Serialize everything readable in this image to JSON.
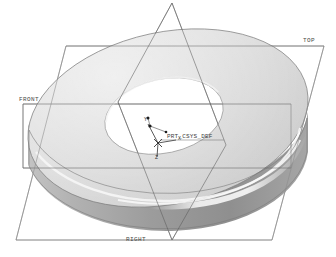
{
  "viewport": {
    "background_color": "#ffffff",
    "model_name": "torus-washer-solid"
  },
  "datum_planes": [
    {
      "id": "top",
      "label": "TOP",
      "label_x": 303,
      "label_y": 40
    },
    {
      "id": "front",
      "label": "FRONT",
      "label_x": 20,
      "label_y": 99
    },
    {
      "id": "right",
      "label": "RIGHT",
      "label_x": 126,
      "label_y": 239
    }
  ],
  "coordinate_system": {
    "name": "PRT_CSYS_DEF",
    "label_x": 166,
    "label_y": 134,
    "origin_x": 158,
    "origin_y": 143,
    "axes": [
      {
        "name": "X",
        "label": "X",
        "label_x": 178,
        "label_y": 139
      },
      {
        "name": "Y",
        "label": "Y",
        "label_x": 146,
        "label_y": 122
      },
      {
        "name": "Z",
        "label": "Z",
        "label_x": 155,
        "label_y": 156
      }
    ]
  },
  "colors": {
    "top_face": "#d7d7d7",
    "top_face_light": "#e2e2e2",
    "outer_wall": "#9c9c9c",
    "outer_wall_dark": "#8a8a8a",
    "inner_bore": "#b9b9b9",
    "inner_bore_dark": "#a4a4a4",
    "highlight": "#f2f2f2",
    "datum_line": "#6e6e6e",
    "datum_line_soft": "#8d8d8d",
    "outline": "#707070",
    "csys_line": "#3a3a3a",
    "text": "#4a4a4a"
  },
  "geometry": {
    "top_ellipse": {
      "cx": 168,
      "cy": 118,
      "rx": 142,
      "ry": 86,
      "rot": -12
    },
    "bore_ellipse": {
      "cx": 164,
      "cy": 116,
      "rx": 60,
      "ry": 37,
      "rot": -12
    },
    "extrude_depth": 40
  }
}
